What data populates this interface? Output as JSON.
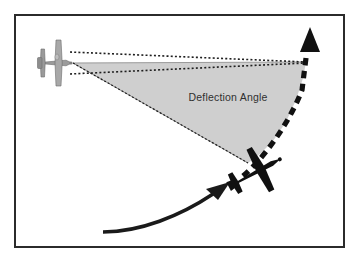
{
  "figure": {
    "kind": "technical-diagram",
    "background_color": "#ffffff",
    "border": {
      "color": "#2b2b2b",
      "width_px": 2,
      "rect": {
        "x": 14,
        "y": 14,
        "width": 331,
        "height": 234
      },
      "inner_color": "#ffffff"
    }
  },
  "labels": {
    "deflection_angle": {
      "text": "Deflection Angle",
      "color": "#2f2f2f",
      "x": 228,
      "y": 101
    }
  },
  "shapes": {
    "wedge": {
      "name": "deflection-angle-wedge",
      "fill": "#cfcfcf",
      "stroke": "#8f8f8f",
      "apex": {
        "x": 73,
        "y": 63
      },
      "top_edge_end": {
        "x": 306,
        "y": 62
      },
      "lower_vertex": {
        "x": 248,
        "y": 163
      }
    },
    "sight_lines": {
      "name": "dotted-sight-lines",
      "color": "#1f1f1f",
      "style": "dotted",
      "upper": {
        "from": {
          "x": 70,
          "y": 51
        },
        "to": {
          "x": 306,
          "y": 62
        }
      },
      "lower": {
        "from": {
          "x": 70,
          "y": 73
        },
        "to": {
          "x": 306,
          "y": 63
        }
      },
      "aim_line": {
        "from": {
          "x": 73,
          "y": 63
        },
        "to": {
          "x": 248,
          "y": 163
        }
      }
    },
    "target_path": {
      "name": "dashed-target-flight-path",
      "color": "#111111",
      "style": "dashed",
      "dash": "7 5",
      "width_px": 5,
      "arrow_tip": {
        "x": 310,
        "y": 28
      },
      "start": {
        "x": 243,
        "y": 175
      }
    },
    "attacker_path": {
      "name": "solid-curved-approach-arrow",
      "color": "#1a1a1a",
      "style": "solid",
      "width_px": 4,
      "arrow_tip": {
        "x": 228,
        "y": 186
      },
      "start": {
        "x": 103,
        "y": 232
      }
    }
  },
  "aircraft": {
    "shooter": {
      "name": "gray-shooter-aircraft",
      "description": "light gray plan-view aircraft, nose pointing right",
      "fill": "#a6a6a6",
      "outline": "#6e6e6e",
      "center": {
        "x": 58,
        "y": 63
      },
      "heading_deg": 0
    },
    "target": {
      "name": "dark-target-aircraft",
      "description": "black silhouette aircraft banking up and to the right",
      "fill": "#101010",
      "center": {
        "x": 256,
        "y": 172
      },
      "heading_deg": -28
    }
  }
}
